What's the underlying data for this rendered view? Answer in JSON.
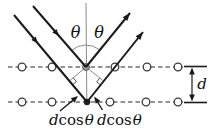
{
  "labels": {
    "theta_left": "θ",
    "theta_right": "θ",
    "spacing": "d",
    "path_diff": {
      "d": "d",
      "cos": "cos",
      "theta": "θ"
    }
  },
  "colors": {
    "ink": "#1b1b1b",
    "construction": "#8b8b8b",
    "background": "#ffffff"
  }
}
